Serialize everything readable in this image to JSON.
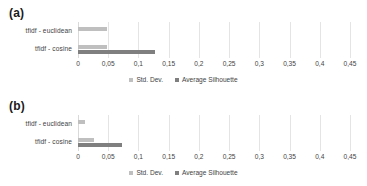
{
  "figure": {
    "panels": [
      {
        "label": "(a)",
        "categories": [
          "tfidf - euclidean",
          "tfidf - cosine"
        ],
        "series": [
          {
            "name": "Std. Dev.",
            "color": "#bfbfbf",
            "values": [
              0.048,
              0.048
            ]
          },
          {
            "name": "Average Silhouette",
            "color": "#7f7f7f",
            "values": [
              0.0,
              0.127
            ]
          }
        ]
      },
      {
        "label": "(b)",
        "categories": [
          "tfidf - euclidean",
          "tfidf - cosine"
        ],
        "series": [
          {
            "name": "Std. Dev.",
            "color": "#bfbfbf",
            "values": [
              0.012,
              0.027
            ]
          },
          {
            "name": "Average Silhouette",
            "color": "#7f7f7f",
            "values": [
              0.0,
              0.072
            ]
          }
        ]
      }
    ],
    "xticks": [
      "0",
      "0,05",
      "0,1",
      "0,15",
      "0,2",
      "0,25",
      "0,3",
      "0,35",
      "0,4",
      "0,45"
    ],
    "legend": [
      "Std. Dev.",
      "Average Silhouette"
    ]
  },
  "chart_data": [
    {
      "type": "bar",
      "orientation": "horizontal",
      "title": "(a)",
      "xlabel": "",
      "ylabel": "",
      "categories": [
        "tfidf - euclidean",
        "tfidf - cosine"
      ],
      "series": [
        {
          "name": "Std. Dev.",
          "values": [
            0.048,
            0.048
          ],
          "color": "#bfbfbf"
        },
        {
          "name": "Average Silhouette",
          "values": [
            0.0,
            0.127
          ],
          "color": "#7f7f7f"
        }
      ],
      "xlim": [
        0,
        0.45
      ],
      "xticks": [
        0,
        0.05,
        0.1,
        0.15,
        0.2,
        0.25,
        0.3,
        0.35,
        0.4,
        0.45
      ],
      "xtick_labels": [
        "0",
        "0,05",
        "0,1",
        "0,15",
        "0,2",
        "0,25",
        "0,3",
        "0,35",
        "0,4",
        "0,45"
      ],
      "grid": "vertical",
      "legend_position": "bottom"
    },
    {
      "type": "bar",
      "orientation": "horizontal",
      "title": "(b)",
      "xlabel": "",
      "ylabel": "",
      "categories": [
        "tfidf - euclidean",
        "tfidf - cosine"
      ],
      "series": [
        {
          "name": "Std. Dev.",
          "values": [
            0.012,
            0.027
          ],
          "color": "#bfbfbf"
        },
        {
          "name": "Average Silhouette",
          "values": [
            0.0,
            0.072
          ],
          "color": "#7f7f7f"
        }
      ],
      "xlim": [
        0,
        0.45
      ],
      "xticks": [
        0,
        0.05,
        0.1,
        0.15,
        0.2,
        0.25,
        0.3,
        0.35,
        0.4,
        0.45
      ],
      "xtick_labels": [
        "0",
        "0,05",
        "0,1",
        "0,15",
        "0,2",
        "0,25",
        "0,3",
        "0,35",
        "0,4",
        "0,45"
      ],
      "grid": "vertical",
      "legend_position": "bottom"
    }
  ]
}
